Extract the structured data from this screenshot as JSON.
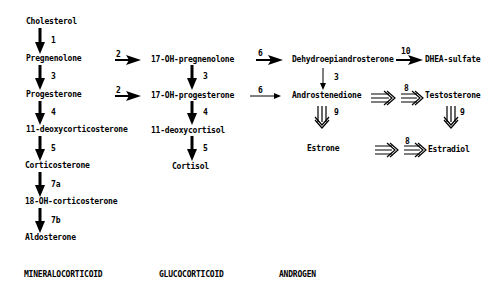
{
  "nodes": {
    "cholesterol": "Cholesterol",
    "pregnenolone": "Pregnenolone",
    "progesterone": "Progesterone",
    "deoxycorticosterone": "11-deoxycorticosterone",
    "corticosterone": "Corticosterone",
    "oh18_corticosterone": "18-OH-corticosterone",
    "aldosterone": "Aldosterone",
    "oh17_pregnenolone": "17-OH-pregnenolone",
    "oh17_progesterone": "17-OH-progesterone",
    "deoxycortisol": "11-deoxycortisol",
    "cortisol": "Cortisol",
    "dhea": "Dehydroepiandrosterone",
    "dhea_sulfate": "DHEA-sulfate",
    "androstenedione": "Androstenedione",
    "testosterone": "Testosterone",
    "estrone": "Estrone",
    "estradiol": "Estradiol"
  },
  "steps": {
    "chol_preg": "1",
    "preg_prog": "3",
    "prog_doc": "4",
    "doc_cort": "5",
    "cort_18oh": "7a",
    "oh18_aldo": "7b",
    "preg_17ohpreg": "2",
    "prog_17ohprog": "2",
    "ohpreg_ohprog": "3",
    "ohprog_deoxycortisol": "4",
    "deoxycortisol_cortisol": "5",
    "ohpreg_dhea": "6",
    "ohprog_andro": "6",
    "dhea_andro": "3",
    "dhea_sulfate": "10",
    "andro_testo": "8",
    "andro_estrone": "9",
    "testo_estradiol": "9",
    "estrone_estradiol": "8"
  },
  "columns": {
    "mineralocorticoid": "MINERALOCORTICOID",
    "glucocorticoid": "GLUCOCORTICOID",
    "androgen": "ANDROGEN"
  }
}
